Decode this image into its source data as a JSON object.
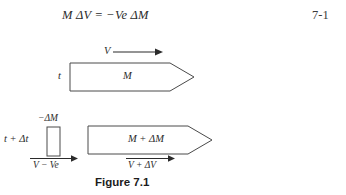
{
  "equation": {
    "text": "M ΔV = −Ve ΔM",
    "lhs_mass": "M",
    "lhs_delta_v": "ΔV",
    "equals": "=",
    "rhs": "−Ve ΔM",
    "number": "7-1"
  },
  "diagram_top": {
    "time_label": "t",
    "body_label": "M",
    "velocity_label": "V"
  },
  "diagram_bottom": {
    "time_label": "t + Δt",
    "ejected_mass_label": "−ΔM",
    "ejected_velocity_label": "V − Ve",
    "body_label": "M + ΔM",
    "body_velocity_label": "V + ΔV"
  },
  "caption": {
    "text": "Figure 7.1"
  },
  "colors": {
    "background": "#ffffff",
    "ink": "#2b2b2b",
    "stroke": "#4a4a4a",
    "caption": "#1c1c1c"
  }
}
